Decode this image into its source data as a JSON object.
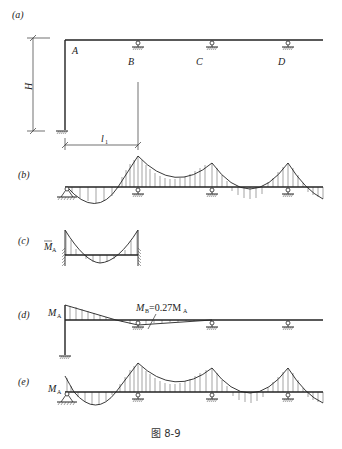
{
  "figure": {
    "caption": "图 8-9",
    "panels": [
      {
        "id": "a",
        "label": "(a)",
        "description": "Frame geometry: column of height H fixed at base, continuous beam A-B-C-D on roller supports"
      },
      {
        "id": "b",
        "label": "(b)",
        "description": "Moment diagram of continuous beam with pin at A"
      },
      {
        "id": "c",
        "label": "(c)",
        "description": "Fixed-end moment diagram for span AB"
      },
      {
        "id": "d",
        "label": "(d)",
        "description": "Moment diagram due to M_A"
      },
      {
        "id": "e",
        "label": "(e)",
        "description": "Final moment diagram"
      }
    ]
  },
  "labels": {
    "panel_a": "(a)",
    "panel_b": "(b)",
    "panel_c": "(c)",
    "panel_d": "(d)",
    "panel_e": "(e)",
    "node_A": "A",
    "node_B": "B",
    "node_C": "C",
    "node_D": "D",
    "dim_H": "H",
    "dim_l": "l",
    "dim_l_sub": "1",
    "mbar": "M",
    "mbar_sub": "A",
    "ma_d": "M",
    "ma_d_sub": "A",
    "mb_main": "M",
    "mb_sub": "B",
    "mb_eq": "=0.27M",
    "mb_eq_sub": "A",
    "ma_e": "M",
    "ma_e_sub": "A"
  },
  "caption": "图 8-9"
}
